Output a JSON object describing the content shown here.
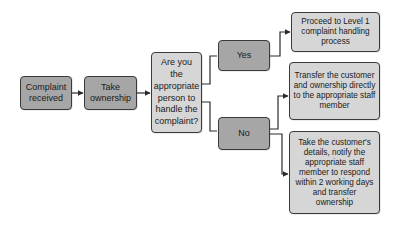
{
  "diagram": {
    "type": "flowchart",
    "nodes": {
      "complaint_received": "Complaint received",
      "take_ownership": "Take ownership",
      "question": "Are you the appropriate person to handle the complaint?",
      "yes": "Yes",
      "no": "No",
      "proceed_level1": "Proceed to Level 1 complaint handling process",
      "transfer_directly": "Transfer the customer and ownership directly to the appropriate staff member",
      "take_details": "Take the customer's details, notify the appropriate staff member to respond within 2 working days and transfer ownership"
    },
    "edges": [
      [
        "complaint_received",
        "take_ownership"
      ],
      [
        "take_ownership",
        "question"
      ],
      [
        "question",
        "yes"
      ],
      [
        "question",
        "no"
      ],
      [
        "yes",
        "proceed_level1"
      ],
      [
        "no",
        "transfer_directly"
      ],
      [
        "no",
        "take_details"
      ]
    ],
    "colors": {
      "dark_fill": "#a6a6a6",
      "light_fill": "#d6d6d6",
      "stroke": "#3a3a3a"
    }
  }
}
